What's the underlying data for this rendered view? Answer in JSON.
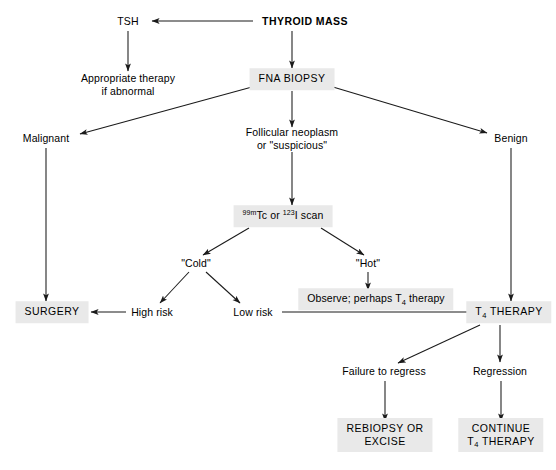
{
  "diagram": {
    "colors": {
      "box_fill": "#e9e9e9",
      "line": "#1a1a1a",
      "text": "#000000",
      "background": "#ffffff"
    },
    "nodes": [
      {
        "id": "thyroid_mass",
        "label": "THYROID MASS",
        "style": "plain-bold",
        "x": 305,
        "y": 21
      },
      {
        "id": "tsh",
        "label": "TSH",
        "style": "plain",
        "x": 128,
        "y": 21
      },
      {
        "id": "appropriate",
        "line1": "Appropriate therapy",
        "line2": "if abnormal",
        "style": "plain",
        "x": 128,
        "y": 84
      },
      {
        "id": "fna_biopsy",
        "label": "FNA BIOPSY",
        "style": "boxed",
        "x": 292,
        "y": 79
      },
      {
        "id": "malignant",
        "label": "Malignant",
        "style": "plain",
        "x": 46,
        "y": 138
      },
      {
        "id": "follicular",
        "line1": "Follicular neoplasm",
        "line2": "or \"suspicious\"",
        "style": "plain",
        "x": 292,
        "y": 138
      },
      {
        "id": "benign",
        "label": "Benign",
        "style": "plain",
        "x": 511,
        "y": 138
      },
      {
        "id": "scan",
        "label": "99mTc or 123I scan",
        "style": "boxed",
        "x": 283,
        "y": 216
      },
      {
        "id": "cold",
        "label": "\"Cold\"",
        "style": "plain",
        "x": 196,
        "y": 263
      },
      {
        "id": "hot",
        "label": "\"Hot\"",
        "style": "plain",
        "x": 368,
        "y": 263
      },
      {
        "id": "observe",
        "label": "Observe; perhaps T4 therapy",
        "style": "boxed",
        "x": 376,
        "y": 299
      },
      {
        "id": "surgery",
        "label": "SURGERY",
        "style": "boxed",
        "x": 52,
        "y": 312
      },
      {
        "id": "high_risk",
        "label": "High risk",
        "style": "plain",
        "x": 152,
        "y": 312
      },
      {
        "id": "low_risk",
        "label": "Low risk",
        "style": "plain",
        "x": 253,
        "y": 312
      },
      {
        "id": "t4_therapy",
        "label": "T4 THERAPY",
        "style": "boxed",
        "x": 509,
        "y": 312
      },
      {
        "id": "failure",
        "label": "Failure to regress",
        "style": "plain",
        "x": 384,
        "y": 371
      },
      {
        "id": "regression",
        "label": "Regression",
        "style": "plain",
        "x": 500,
        "y": 371
      },
      {
        "id": "rebiopsy",
        "line1": "REBIOPSY OR",
        "line2": "EXCISE",
        "style": "boxed",
        "x": 385,
        "y": 435
      },
      {
        "id": "continue",
        "line1": "CONTINUE",
        "line2": "T4 THERAPY",
        "style": "boxed",
        "x": 501,
        "y": 435
      }
    ],
    "labels": {
      "thyroid_mass": "THYROID MASS",
      "tsh": "TSH",
      "appropriate_line1": "Appropriate therapy",
      "appropriate_line2": "if abnormal",
      "fna_biopsy": "FNA BIOPSY",
      "malignant": "Malignant",
      "follicular_line1": "Follicular neoplasm",
      "follicular_line2": "or \"suspicious\"",
      "benign": "Benign",
      "scan_sup1": "99m",
      "scan_mid1": "Tc or ",
      "scan_sup2": "123",
      "scan_tail": "I scan",
      "cold": "\"Cold\"",
      "hot": "\"Hot\"",
      "observe_pre": "Observe; perhaps T",
      "observe_sub": "4",
      "observe_post": " therapy",
      "surgery": "SURGERY",
      "high_risk": "High risk",
      "low_risk": "Low risk",
      "t4_therapy_pre": "T",
      "t4_therapy_sub": "4",
      "t4_therapy_post": " THERAPY",
      "failure": "Failure to regress",
      "regression": "Regression",
      "rebiopsy_line1": "REBIOPSY OR",
      "rebiopsy_line2": "EXCISE",
      "continue_line1": "CONTINUE",
      "continue_sub": "4",
      "continue_line2_pre": "T",
      "continue_line2_post": " THERAPY"
    },
    "edges": [
      {
        "id": "mass-to-tsh",
        "from": "thyroid_mass",
        "to": "tsh",
        "arrow": true
      },
      {
        "id": "tsh-to-appropriate",
        "from": "tsh",
        "to": "appropriate",
        "arrow": true
      },
      {
        "id": "mass-to-fna",
        "from": "thyroid_mass",
        "to": "fna_biopsy",
        "arrow": true
      },
      {
        "id": "fna-to-malignant",
        "from": "fna_biopsy",
        "to": "malignant",
        "arrow": true
      },
      {
        "id": "fna-to-follicular",
        "from": "fna_biopsy",
        "to": "follicular",
        "arrow": true
      },
      {
        "id": "fna-to-benign",
        "from": "fna_biopsy",
        "to": "benign",
        "arrow": true
      },
      {
        "id": "malignant-to-surgery",
        "from": "malignant",
        "to": "surgery",
        "arrow": true
      },
      {
        "id": "follicular-to-scan",
        "from": "follicular",
        "to": "scan",
        "arrow": true
      },
      {
        "id": "benign-to-t4",
        "from": "benign",
        "to": "t4_therapy",
        "arrow": true
      },
      {
        "id": "scan-to-cold",
        "from": "scan",
        "to": "cold",
        "arrow": true
      },
      {
        "id": "scan-to-hot",
        "from": "scan",
        "to": "hot",
        "arrow": true
      },
      {
        "id": "cold-to-high-risk",
        "from": "cold",
        "to": "high_risk",
        "arrow": true
      },
      {
        "id": "cold-to-low-risk",
        "from": "cold",
        "to": "low_risk",
        "arrow": true
      },
      {
        "id": "hot-to-observe",
        "from": "hot",
        "to": "observe",
        "arrow": true
      },
      {
        "id": "high-risk-to-surgery",
        "from": "high_risk",
        "to": "surgery",
        "arrow": true
      },
      {
        "id": "low-risk-to-t4",
        "from": "low_risk",
        "to": "t4_therapy",
        "arrow": true
      },
      {
        "id": "t4-to-failure",
        "from": "t4_therapy",
        "to": "failure",
        "arrow": true
      },
      {
        "id": "t4-to-regression",
        "from": "t4_therapy",
        "to": "regression",
        "arrow": true
      },
      {
        "id": "failure-to-rebiopsy",
        "from": "failure",
        "to": "rebiopsy",
        "arrow": true
      },
      {
        "id": "regression-to-continue",
        "from": "regression",
        "to": "continue",
        "arrow": true
      }
    ]
  }
}
